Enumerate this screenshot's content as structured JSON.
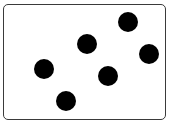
{
  "figure": {
    "frame": {
      "left": 3,
      "top": 4,
      "width": 161,
      "height": 114,
      "border_color": "#3a3a3a",
      "background": "#ffffff"
    },
    "dot_color": "#000000",
    "dot_diameter": 20,
    "dot_count": 6,
    "dots": [
      {
        "cx": 44,
        "cy": 69
      },
      {
        "cx": 66,
        "cy": 101
      },
      {
        "cx": 87,
        "cy": 44
      },
      {
        "cx": 108,
        "cy": 76
      },
      {
        "cx": 128,
        "cy": 22
      },
      {
        "cx": 149,
        "cy": 54
      }
    ]
  }
}
